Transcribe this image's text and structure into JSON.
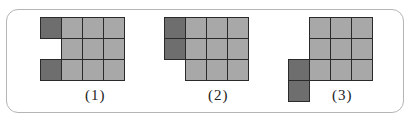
{
  "figures": [
    {
      "label": "(1)",
      "cells": [
        {
          "r": 0,
          "c": 0,
          "t": "dark"
        },
        {
          "r": 0,
          "c": 1,
          "t": "light"
        },
        {
          "r": 0,
          "c": 2,
          "t": "light"
        },
        {
          "r": 0,
          "c": 3,
          "t": "light"
        },
        {
          "r": 1,
          "c": 1,
          "t": "light"
        },
        {
          "r": 1,
          "c": 2,
          "t": "light"
        },
        {
          "r": 1,
          "c": 3,
          "t": "light"
        },
        {
          "r": 2,
          "c": 0,
          "t": "dark"
        },
        {
          "r": 2,
          "c": 1,
          "t": "light"
        },
        {
          "r": 2,
          "c": 2,
          "t": "light"
        },
        {
          "r": 2,
          "c": 3,
          "t": "light"
        }
      ]
    },
    {
      "label": "(2)",
      "cells": [
        {
          "r": 0,
          "c": 0,
          "t": "dark"
        },
        {
          "r": 0,
          "c": 1,
          "t": "light"
        },
        {
          "r": 0,
          "c": 2,
          "t": "light"
        },
        {
          "r": 0,
          "c": 3,
          "t": "light"
        },
        {
          "r": 1,
          "c": 0,
          "t": "dark"
        },
        {
          "r": 1,
          "c": 1,
          "t": "light"
        },
        {
          "r": 1,
          "c": 2,
          "t": "light"
        },
        {
          "r": 1,
          "c": 3,
          "t": "light"
        },
        {
          "r": 2,
          "c": 1,
          "t": "light"
        },
        {
          "r": 2,
          "c": 2,
          "t": "light"
        },
        {
          "r": 2,
          "c": 3,
          "t": "light"
        }
      ]
    },
    {
      "label": "(3)",
      "cells": [
        {
          "r": 0,
          "c": 1,
          "t": "light"
        },
        {
          "r": 0,
          "c": 2,
          "t": "light"
        },
        {
          "r": 0,
          "c": 3,
          "t": "light"
        },
        {
          "r": 1,
          "c": 1,
          "t": "light"
        },
        {
          "r": 1,
          "c": 2,
          "t": "light"
        },
        {
          "r": 1,
          "c": 3,
          "t": "light"
        },
        {
          "r": 2,
          "c": 0,
          "t": "dark"
        },
        {
          "r": 2,
          "c": 1,
          "t": "light"
        },
        {
          "r": 2,
          "c": 2,
          "t": "light"
        },
        {
          "r": 2,
          "c": 3,
          "t": "light"
        },
        {
          "r": 3,
          "c": 0,
          "t": "dark"
        }
      ]
    }
  ],
  "colors": {
    "light": "#a8a8a8",
    "dark": "#6e6e6e",
    "grid_line": "#2a2a2a",
    "frame": "#b5b5b5"
  }
}
